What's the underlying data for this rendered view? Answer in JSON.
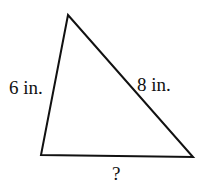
{
  "diagram": {
    "type": "triangle",
    "vertices": {
      "top": [
        68,
        15
      ],
      "bottom_left": [
        41,
        155
      ],
      "bottom_right": [
        193,
        157
      ]
    },
    "stroke_color": "#111111",
    "sides": [
      {
        "id": "left",
        "label": "6 in."
      },
      {
        "id": "right",
        "label": "8 in."
      },
      {
        "id": "bottom",
        "label": "?"
      }
    ]
  }
}
